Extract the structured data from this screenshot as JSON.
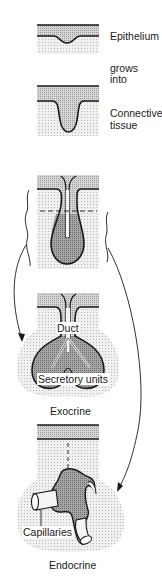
{
  "diagram": {
    "colors": {
      "epithelium_fill": "#c8c8c8",
      "connective_fill": "#e4e4e4",
      "gland_fill": "#a8a8a8",
      "line": "#1a1a1a",
      "background": "#ffffff"
    },
    "labels": {
      "epithelium": "Epithelium",
      "grows": "grows",
      "into": "into",
      "connective": "Connective",
      "tissue": "tissue",
      "duct": "Duct",
      "secretory_units": "Secretory units",
      "exocrine": "Exocrine",
      "capillaries": "Capillaries",
      "endocrine": "Endocrine"
    },
    "stages": [
      {
        "id": "stage-1",
        "description": "Flat epithelium over connective tissue with slight invagination"
      },
      {
        "id": "stage-2",
        "description": "Epithelium grows into connective tissue as a finger-like downgrowth"
      },
      {
        "id": "stage-3",
        "description": "Bulbous gland rudiment with central lumen; dashed line marks fate split"
      },
      {
        "id": "stage-4",
        "name": "Exocrine",
        "description": "Duct retained, branching into secretory units"
      },
      {
        "id": "stage-5",
        "name": "Endocrine",
        "description": "Duct lost; cells cluster around capillaries"
      }
    ],
    "arrows": [
      {
        "from": "stage-3",
        "to": "stage-4",
        "side": "left"
      },
      {
        "from": "stage-3",
        "to": "stage-5",
        "side": "right"
      }
    ]
  }
}
